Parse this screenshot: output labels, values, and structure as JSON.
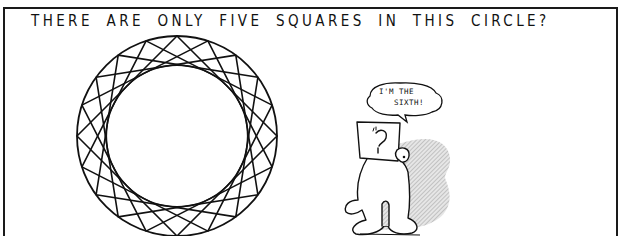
{
  "title": "THERE ARE ONLY FIVE SQUARES IN THIS CIRCLE?",
  "figure": {
    "squares_count": 5,
    "circle": {
      "cx": 177,
      "cy": 136,
      "r": 100,
      "stroke": "#111111"
    }
  },
  "character": {
    "speech_line1": "I'M THE",
    "speech_line2": "SIXTH!"
  },
  "colors": {
    "ink": "#111111",
    "background": "#ffffff",
    "shadow": "#c8c8c8"
  }
}
